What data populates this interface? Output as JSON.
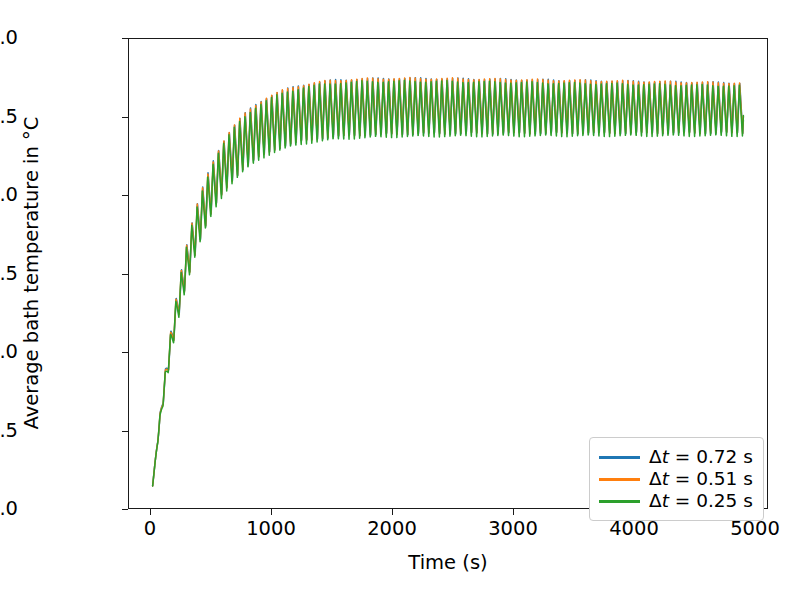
{
  "chart_data": {
    "type": "line",
    "title": "",
    "xlabel": "Time (s)",
    "ylabel": "Average bath temperature in °C",
    "xlim": [
      -200,
      5200
    ],
    "ylim": [
      959.85,
      963.05
    ],
    "xticks": [
      0,
      1000,
      2000,
      3000,
      4000,
      5000
    ],
    "xtick_labels": [
      "0",
      "1000",
      "2000",
      "3000",
      "4000",
      "5000"
    ],
    "yticks": [
      960.0,
      960.5,
      961.0,
      961.5,
      962.0,
      962.5,
      963.0
    ],
    "ytick_labels": [
      "960.0",
      "960.5",
      "961.0",
      "961.5",
      "962.0",
      "962.5",
      "963.0"
    ],
    "grid": false,
    "legend_position": "lower right",
    "oscillation_period_s": 45,
    "series": [
      {
        "name": "Δt = 0.72 s",
        "label_prefix": "Δ",
        "label_var": "t",
        "label_suffix": " = 0.72 s",
        "color": "#1f77b4",
        "envelope_start": 960.0,
        "envelope_plateau_mean": 962.6,
        "rise_time_constant_s": 330,
        "amplitude_final": 0.2,
        "peak_plateau": 962.81,
        "trough_plateau": 962.41
      },
      {
        "name": "Δt = 0.51 s",
        "label_prefix": "Δ",
        "label_var": "t",
        "label_suffix": " = 0.51 s",
        "color": "#ff7f0e",
        "envelope_start": 960.0,
        "envelope_plateau_mean": 962.6,
        "rise_time_constant_s": 330,
        "amplitude_final": 0.2,
        "peak_plateau": 962.82,
        "trough_plateau": 962.4
      },
      {
        "name": "Δt = 0.25 s",
        "label_prefix": "Δ",
        "label_var": "t",
        "label_suffix": " = 0.25 s",
        "color": "#2ca02c",
        "envelope_start": 960.0,
        "envelope_plateau_mean": 962.58,
        "rise_time_constant_s": 330,
        "amplitude_final": 0.2,
        "peak_plateau": 962.79,
        "trough_plateau": 962.38
      }
    ],
    "notes": {
      "start_value": 960.0,
      "plateau_reached_at_s": 1200,
      "max_value": 962.82,
      "min_value": 960.0,
      "final_value_approx": 962.6
    }
  },
  "legend": {
    "items": [
      {
        "label": "Δt = 0.72 s",
        "color": "#1f77b4"
      },
      {
        "label": "Δt = 0.51 s",
        "color": "#ff7f0e"
      },
      {
        "label": "Δt = 0.25 s",
        "color": "#2ca02c"
      }
    ]
  },
  "axes": {
    "xlabel": "Time (s)",
    "ylabel": "Average bath temperature in °C",
    "xtick_labels": [
      "0",
      "1000",
      "2000",
      "3000",
      "4000",
      "5000"
    ],
    "ytick_labels": [
      "960.0",
      "960.5",
      "961.0",
      "961.5",
      "962.0",
      "962.5",
      "963.0"
    ]
  },
  "style": {
    "background": "#ffffff",
    "axis_color": "#1a1a1a",
    "legend_border": "#cccccc"
  }
}
